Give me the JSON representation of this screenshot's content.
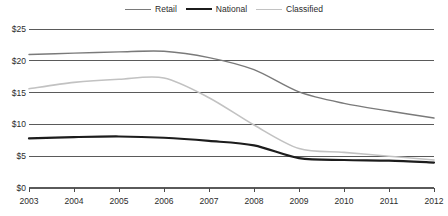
{
  "chart_data": {
    "type": "line",
    "title": "",
    "xlabel": "",
    "ylabel": "",
    "x": [
      2003,
      2004,
      2005,
      2006,
      2007,
      2008,
      2009,
      2010,
      2011,
      2012
    ],
    "xtick_labels": [
      "2003",
      "2004",
      "2005",
      "2006",
      "2007",
      "2008",
      "2009",
      "2010",
      "2011",
      "2012"
    ],
    "ytick_labels": [
      "$0",
      "$5",
      "$10",
      "$15",
      "$20",
      "$25"
    ],
    "ytick_values": [
      0,
      5,
      10,
      15,
      20,
      25
    ],
    "ylim": [
      0,
      25
    ],
    "xlim": [
      2003,
      2012
    ],
    "grid": true,
    "grid_axis": "y",
    "legend_position": "top-center",
    "units": "billions of dollars",
    "series": [
      {
        "name": "Retail",
        "color": "#7a7a7a",
        "width": 1.4,
        "values": [
          21.0,
          21.2,
          21.4,
          21.5,
          20.5,
          18.6,
          15.1,
          13.3,
          12.1,
          11.0
        ]
      },
      {
        "name": "National",
        "color": "#1c1c1c",
        "width": 2.2,
        "values": [
          7.8,
          8.0,
          8.1,
          7.9,
          7.4,
          6.7,
          4.7,
          4.4,
          4.3,
          4.0
        ]
      },
      {
        "name": "Classified",
        "color": "#c2c2c2",
        "width": 1.6,
        "values": [
          15.6,
          16.6,
          17.1,
          17.3,
          14.2,
          9.9,
          6.2,
          5.6,
          5.0,
          4.4
        ]
      }
    ]
  },
  "legend": {
    "items": [
      {
        "label": "Retail",
        "swatch": "line-swatch-retail"
      },
      {
        "label": "National",
        "swatch": "line-swatch-national"
      },
      {
        "label": "Classified",
        "swatch": "line-swatch-classified"
      }
    ]
  },
  "colors": {
    "retail": "#7a7a7a",
    "national": "#1c1c1c",
    "classified": "#c2c2c2",
    "gridline": "#5a5a5a",
    "axis": "#4a4a4a",
    "text": "#2b2b2b",
    "background": "#ffffff"
  }
}
